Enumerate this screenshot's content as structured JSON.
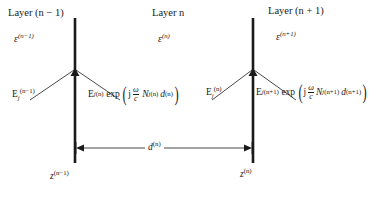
{
  "figure": {
    "kind": "optics-multilayer-interface-diagram",
    "background_color": "#ffffff",
    "line_color": "#1a1a1a"
  },
  "layers": [
    {
      "title_prefix": "Layer",
      "title_var": "n",
      "title_suffix": "− 1",
      "title_paren": true,
      "permittivity_symbol": "ε",
      "permittivity_sup": "(n−1)"
    },
    {
      "title_prefix": "Layer",
      "title_var": "n",
      "title_suffix": "",
      "title_paren": false,
      "permittivity_symbol": "ε",
      "permittivity_sup": "(n)"
    },
    {
      "title_prefix": "Layer",
      "title_var": "n",
      "title_suffix": "+ 1",
      "title_paren": true,
      "permittivity_symbol": "ε",
      "permittivity_sup": "(n+1)"
    }
  ],
  "titles": {
    "layer_left": "Layer (n − 1)",
    "layer_mid": "Layer n",
    "layer_right": "Layer (n + 1)"
  },
  "permittivities": {
    "left": "ε(n−1)",
    "mid": "ε(n)",
    "right": "ε(n+1)"
  },
  "fields": {
    "left_incoming": {
      "symbol": "E",
      "sub": "j",
      "sup": "(n−1)",
      "full": "E_j^(n−1)"
    },
    "left_outgoing": {
      "symbol": "E",
      "sub": "j",
      "sup": "(n)",
      "exp_label": "exp",
      "exp_imag": "j",
      "frac_num": "ω",
      "frac_den": "c",
      "N_symbol": "N",
      "N_sub": "j",
      "N_sup": "(n)",
      "d_symbol": "d",
      "d_sup": "(n)",
      "full": "E_j^(n) exp( j (ω/c) N_j^(n) d^(n) )"
    },
    "right_incoming": {
      "symbol": "E",
      "sub": "j",
      "sup": "(n)",
      "full": "E_j^(n)"
    },
    "right_outgoing": {
      "symbol": "E",
      "sub": "j",
      "sup": "(n+1)",
      "exp_label": "exp",
      "exp_imag": "j",
      "frac_num": "ω",
      "frac_den": "c",
      "N_symbol": "N",
      "N_sub": "j",
      "N_sup": "(n+1)",
      "d_symbol": "d",
      "d_sup": "(n+1)",
      "full": "E_j^(n+1) exp( j (ω/c) N_j^(n+1) d^(n+1) )"
    }
  },
  "dimension": {
    "label_symbol": "d",
    "label_sup": "(n)",
    "full": "d(n)",
    "arrow_style": "double-headed"
  },
  "positions": {
    "z_left": {
      "symbol": "z",
      "sup": "(n−1)",
      "full": "z(n−1)"
    },
    "z_right": {
      "symbol": "z",
      "sup": "(n)",
      "full": "z(n)"
    }
  },
  "geometry": {
    "interface_left_x": 75,
    "interface_right_x": 253,
    "interface_top_y": 18,
    "interface_bottom_y": 163,
    "vertex_y": 70,
    "dimension_arrow_y": 148
  }
}
